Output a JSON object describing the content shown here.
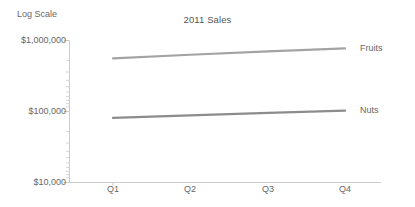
{
  "chart_data": {
    "type": "line",
    "title": "2011 Sales",
    "xlabel": "",
    "ylabel": "Log Scale",
    "yscale": "log",
    "ylim": [
      10000,
      1000000
    ],
    "grid": false,
    "legend_position": "line-end-labels",
    "categories": [
      "Q1",
      "Q2",
      "Q3",
      "Q4"
    ],
    "ytick_labels": [
      "$1,000,000",
      "$100,000",
      "$10,000"
    ],
    "ytick_values": [
      1000000,
      100000,
      10000
    ],
    "series": [
      {
        "name": "Fruits",
        "color": "#a3a3a3",
        "values": [
          550000,
          620000,
          690000,
          760000
        ]
      },
      {
        "name": "Nuts",
        "color": "#8c8c8c",
        "values": [
          80000,
          87000,
          94000,
          101000
        ]
      }
    ]
  },
  "axis": {
    "y_title": "Log Scale",
    "tick_top": "$1,000,000",
    "tick_mid": "$100,000",
    "tick_bottom": "$10,000",
    "x_q1": "Q1",
    "x_q2": "Q2",
    "x_q3": "Q3",
    "x_q4": "Q4",
    "line_color": "#cccccc"
  },
  "labels": {
    "series_fruits": "Fruits",
    "series_nuts": "Nuts"
  },
  "title": {
    "main": "2011 Sales"
  }
}
